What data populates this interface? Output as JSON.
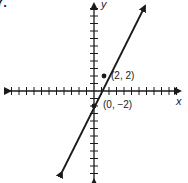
{
  "problem": {
    "number_label": "7."
  },
  "graph": {
    "x_axis_label": "x",
    "y_axis_label": "y",
    "points": [
      {
        "label": "(2, 2)",
        "x": 2,
        "y": 2
      },
      {
        "label": "(0, −2)",
        "x": 0,
        "y": -2
      }
    ],
    "line": {
      "slope": 2,
      "y_intercept": -2,
      "equation": "y = 2x - 2"
    },
    "x_ticks_each_side": 11,
    "y_ticks_each_side": 12,
    "colors": {
      "ink": "#1a1a1a",
      "background": "#ffffff"
    }
  }
}
